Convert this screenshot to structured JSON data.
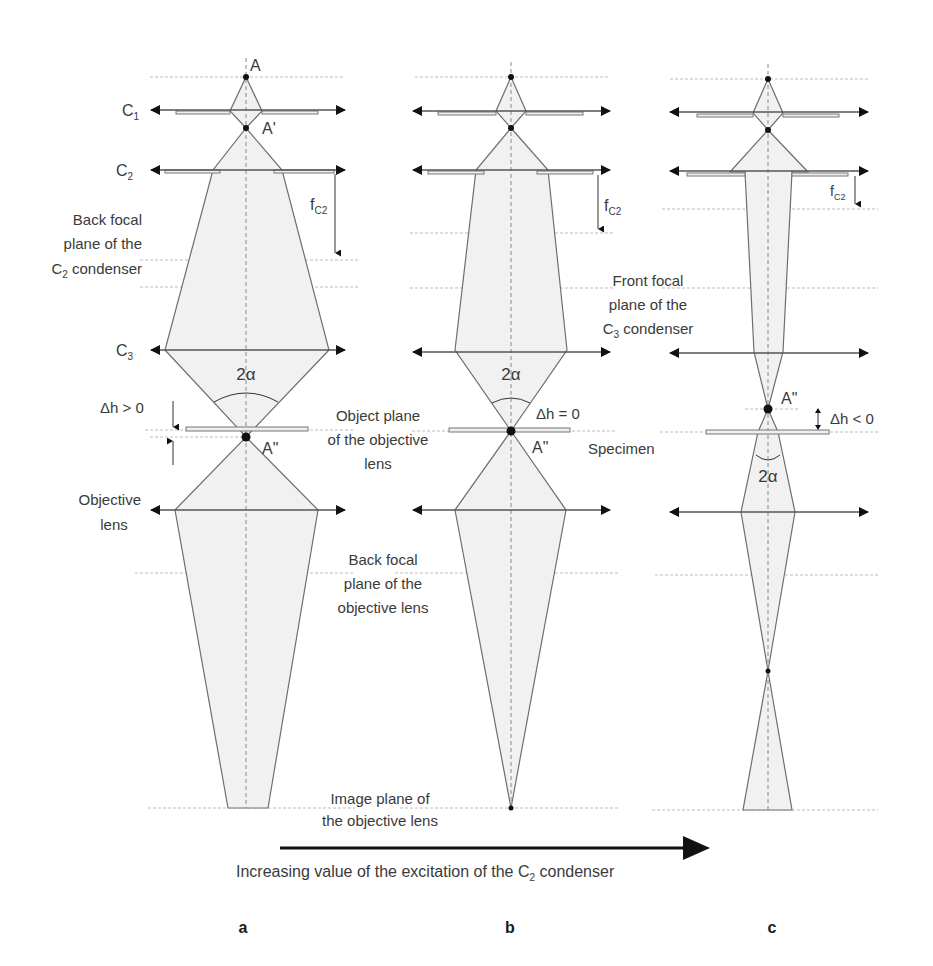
{
  "figure": {
    "panels": [
      {
        "id": "a",
        "label": "a",
        "delta_h": "Δh > 0"
      },
      {
        "id": "b",
        "label": "b",
        "delta_h": "Δh = 0"
      },
      {
        "id": "c",
        "label": "c",
        "delta_h": "Δh < 0"
      }
    ],
    "points": {
      "source": "A",
      "intermediate": "A'",
      "probe": "A\""
    },
    "lenses": {
      "c1": {
        "main": "C",
        "sub": "1"
      },
      "c2": {
        "main": "C",
        "sub": "2"
      },
      "c3": {
        "main": "C",
        "sub": "3"
      },
      "objective_line1": "Objective",
      "objective_line2": "lens"
    },
    "focal_length": {
      "main": "f",
      "sub": "C2"
    },
    "angle_label": "2α",
    "planes": {
      "back_focal_c2": {
        "line1": "Back focal",
        "line2": "plane of the",
        "line3_main": "C",
        "line3_sub": "2",
        "line3_rest": " condenser"
      },
      "front_focal_c3": {
        "line1": "Front focal",
        "line2": "plane of the",
        "line3_main": "C",
        "line3_sub": "3",
        "line3_rest": " condenser"
      },
      "object_plane": {
        "line1": "Object plane",
        "line2": "of the objective",
        "line3": "lens"
      },
      "specimen": "Specimen",
      "back_focal_objective": {
        "line1": "Back focal",
        "line2": "plane of the",
        "line3": "objective lens"
      },
      "image_plane": {
        "line1": "Image plane of",
        "line2": "the objective lens"
      }
    },
    "caption": {
      "prefix": "Increasing value of the excitation of the ",
      "main": "C",
      "sub": "2",
      "suffix": " condenser"
    }
  }
}
